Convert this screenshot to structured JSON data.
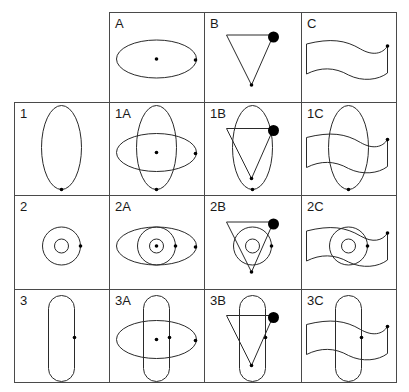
{
  "diagram": {
    "type": "combination-grid",
    "grid": {
      "columns_x": [
        14,
        109,
        204,
        301,
        396
      ],
      "rows_y": [
        12,
        102,
        195,
        289,
        382
      ],
      "header_row_starts_at_column": 1,
      "header_column_starts_at_row": 1
    },
    "column_headers": [
      "A",
      "B",
      "C"
    ],
    "row_headers": [
      "1",
      "2",
      "3"
    ],
    "cells": [
      {
        "id": "A",
        "label": "A",
        "row": 0,
        "col": 1,
        "shapes": [
          "A"
        ]
      },
      {
        "id": "B",
        "label": "B",
        "row": 0,
        "col": 2,
        "shapes": [
          "B"
        ]
      },
      {
        "id": "C",
        "label": "C",
        "row": 0,
        "col": 3,
        "shapes": [
          "C"
        ]
      },
      {
        "id": "1",
        "label": "1",
        "row": 1,
        "col": 0,
        "shapes": [
          "1"
        ]
      },
      {
        "id": "1A",
        "label": "1A",
        "row": 1,
        "col": 1,
        "shapes": [
          "1",
          "A"
        ]
      },
      {
        "id": "1B",
        "label": "1B",
        "row": 1,
        "col": 2,
        "shapes": [
          "1",
          "B"
        ]
      },
      {
        "id": "1C",
        "label": "1C",
        "row": 1,
        "col": 3,
        "shapes": [
          "1",
          "C"
        ]
      },
      {
        "id": "2",
        "label": "2",
        "row": 2,
        "col": 0,
        "shapes": [
          "2"
        ]
      },
      {
        "id": "2A",
        "label": "2A",
        "row": 2,
        "col": 1,
        "shapes": [
          "2",
          "A"
        ]
      },
      {
        "id": "2B",
        "label": "2B",
        "row": 2,
        "col": 2,
        "shapes": [
          "2",
          "B"
        ]
      },
      {
        "id": "2C",
        "label": "2C",
        "row": 2,
        "col": 3,
        "shapes": [
          "2",
          "C"
        ]
      },
      {
        "id": "3",
        "label": "3",
        "row": 3,
        "col": 0,
        "shapes": [
          "3"
        ]
      },
      {
        "id": "3A",
        "label": "3A",
        "row": 3,
        "col": 1,
        "shapes": [
          "3",
          "A"
        ]
      },
      {
        "id": "3B",
        "label": "3B",
        "row": 3,
        "col": 2,
        "shapes": [
          "3",
          "B"
        ]
      },
      {
        "id": "3C",
        "label": "3C",
        "row": 3,
        "col": 3,
        "shapes": [
          "3",
          "C"
        ]
      }
    ],
    "shape_definitions": {
      "A": {
        "kind": "horizontal-ellipse",
        "cx": 48,
        "cy": 47,
        "rx": 40,
        "ry": 19,
        "dots": [
          {
            "x": 48,
            "y": 47,
            "r": 1.8
          },
          {
            "x": 87,
            "y": 48,
            "r": 1.8
          }
        ]
      },
      "B": {
        "kind": "inverted-triangle",
        "points": [
          [
            22,
            23
          ],
          [
            69,
            23
          ],
          [
            47,
            73
          ]
        ],
        "dots": [
          {
            "x": 69,
            "y": 25,
            "r": 5.5
          },
          {
            "x": 47,
            "y": 73,
            "r": 1.8
          }
        ]
      },
      "C": {
        "kind": "wavy-flag",
        "path": "M6 32 C 30 26, 45 28, 60 37 C 72 44, 82 42, 87 34 L 87 61 C 78 68, 62 70, 48 63 C 34 55, 20 55, 6 62 Z",
        "dots": [
          {
            "x": 87,
            "y": 34,
            "r": 1.8
          }
        ]
      },
      "1": {
        "kind": "vertical-ellipse",
        "cx": 48,
        "cy": 42,
        "rx": 20,
        "ry": 42,
        "dots": [
          {
            "x": 48,
            "y": 84,
            "r": 1.8
          }
        ]
      },
      "2": {
        "kind": "concentric-circles",
        "cx": 48,
        "cy": 47,
        "r_outer": 19,
        "r_inner": 7,
        "dots": [
          {
            "x": 67,
            "y": 47,
            "r": 1.8
          }
        ]
      },
      "3": {
        "kind": "vertical-stadium",
        "x": 35,
        "y": 3,
        "width": 26,
        "height": 86,
        "corner_radius": 13,
        "dots": [
          {
            "x": 61,
            "y": 45,
            "r": 1.8
          }
        ]
      }
    },
    "colors": {
      "background": "#ffffff",
      "grid_line": "#4a4a4a",
      "shape_stroke": "#2a2a2a",
      "dot_fill": "#000000",
      "label_text": "#1a1a1a"
    }
  }
}
